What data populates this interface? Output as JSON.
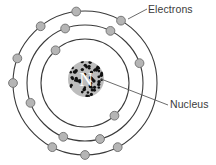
{
  "figure": {
    "kind": "atom-diagram",
    "background_color": "#ffffff"
  },
  "labels": {
    "electrons": "Electrons",
    "nucleus": "Nucleus",
    "text_color": "#3b3b3b"
  },
  "nucleus": {
    "letter": "N",
    "fill_color": "#bdbdbd",
    "dot_color": "#111111",
    "letter_color": "#ffffff",
    "center_x": 86,
    "center_y": 79,
    "radius": 18,
    "dot_count": 58
  },
  "shells": {
    "center_x": 85,
    "center_y": 83,
    "stroke_color": "#3a3a3a",
    "stroke_width": 1.1,
    "electron_fill": "#b5b5b5",
    "electron_stroke": "#6e6e6e",
    "electron_radius": 4.4,
    "rings": [
      {
        "name": "inner-shell",
        "radius": 44,
        "electron_count": 2,
        "electron_angles": [
          312,
          132
        ]
      },
      {
        "name": "middle-shell",
        "radius": 58,
        "electron_count": 6,
        "electron_angles": [
          285,
          248,
          200,
          110,
          64,
          20
        ]
      },
      {
        "name": "outer-shell",
        "radius": 72,
        "electron_count": 8,
        "electron_angles": [
          297,
          270,
          243,
          180,
          160,
          128,
          97,
          60
        ]
      }
    ]
  },
  "leaders": [
    {
      "name": "electrons-leader",
      "x1": 128,
      "y1": 19,
      "x2": 147,
      "y2": 9,
      "color": "#5a5a5a"
    },
    {
      "name": "nucleus-leader",
      "x1": 101,
      "y1": 79,
      "x2": 168,
      "y2": 105,
      "color": "#5a5a5a"
    }
  ],
  "chart_data": {
    "type": "diagram",
    "annotations": [
      "Electrons",
      "Nucleus"
    ],
    "series": [
      {
        "name": "inner-shell",
        "radius": 44,
        "values": 2
      },
      {
        "name": "middle-shell",
        "radius": 58,
        "values": 6
      },
      {
        "name": "outer-shell",
        "radius": 72,
        "values": 8
      }
    ]
  }
}
